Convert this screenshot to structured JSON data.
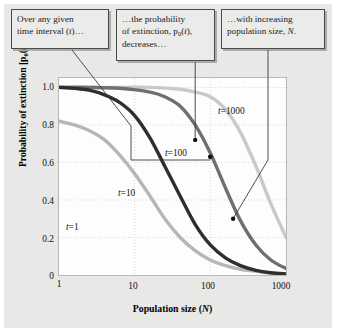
{
  "figure": {
    "background_color": "#e8e8e6",
    "plot_background_color": "#fdfdfd"
  },
  "callouts": [
    {
      "name": "callout-time-interval",
      "line1": "Over any given",
      "line2_pre": "time interval (",
      "line2_var": "t",
      "line2_post": ")…"
    },
    {
      "name": "callout-probability",
      "line1": "…the probability",
      "line2_pre": "of extinction, p",
      "line2_sub": "0",
      "line2_var": "t",
      "line2_post": "),",
      "line3": "decreases…"
    },
    {
      "name": "callout-population-size",
      "line1": "…with increasing",
      "line2_pre": "population size, ",
      "line2_var": "N",
      "line2_post": "."
    }
  ],
  "chart_data": {
    "type": "line",
    "title": "",
    "xlabel_pre": "Population size (",
    "xlabel_var": "N",
    "xlabel_post": ")",
    "ylabel_pre": "Probability of extinction [p",
    "ylabel_sub": "0",
    "ylabel_var": "t",
    "ylabel_post": ")]",
    "x_scale": "log",
    "xlim": [
      1,
      1000
    ],
    "ylim": [
      0,
      1.05
    ],
    "grid": "dotted",
    "legend_position": "inline-labels",
    "xticks": [
      "1",
      "10",
      "100",
      "1000"
    ],
    "xtick_values": [
      1,
      10,
      100,
      1000
    ],
    "yticks": [
      "0",
      "0.2",
      "0.4",
      "0.6",
      "0.8",
      "1.0"
    ],
    "ytick_values": [
      0,
      0.2,
      0.4,
      0.6,
      0.8,
      1.0
    ],
    "series": [
      {
        "name": "t = 1",
        "label_var": "t",
        "label_value": "1",
        "color": "#b6b6b4",
        "x": [
          1,
          1.6,
          2.5,
          4,
          6.3,
          10,
          16,
          25,
          40,
          63,
          100,
          160,
          250,
          400,
          630,
          1000
        ],
        "values": [
          0.82,
          0.8,
          0.77,
          0.72,
          0.64,
          0.54,
          0.42,
          0.3,
          0.2,
          0.13,
          0.08,
          0.05,
          0.03,
          0.02,
          0.01,
          0.005
        ]
      },
      {
        "name": "t = 10",
        "label_var": "t",
        "label_value": "10",
        "color": "#2e2e2e",
        "x": [
          1,
          1.6,
          2.5,
          4,
          6.3,
          10,
          16,
          25,
          40,
          63,
          100,
          160,
          250,
          400,
          630,
          1000
        ],
        "values": [
          1.0,
          0.995,
          0.985,
          0.96,
          0.92,
          0.85,
          0.73,
          0.58,
          0.42,
          0.27,
          0.16,
          0.09,
          0.05,
          0.025,
          0.012,
          0.006
        ]
      },
      {
        "name": "t = 100",
        "label_var": "t",
        "label_value": "100",
        "color": "#6f6f6f",
        "x": [
          1,
          2.5,
          6.3,
          16,
          25,
          40,
          63,
          100,
          160,
          250,
          400,
          630,
          1000
        ],
        "values": [
          1.0,
          1.0,
          0.995,
          0.975,
          0.95,
          0.9,
          0.8,
          0.65,
          0.46,
          0.29,
          0.16,
          0.08,
          0.035
        ]
      },
      {
        "name": "t = 1000",
        "label_var": "t",
        "label_value": "1000",
        "color": "#c9c9c7",
        "x": [
          1,
          6.3,
          16,
          40,
          63,
          100,
          160,
          250,
          400,
          630,
          1000
        ],
        "values": [
          1.0,
          1.0,
          1.0,
          0.99,
          0.975,
          0.95,
          0.88,
          0.76,
          0.58,
          0.38,
          0.2
        ]
      }
    ],
    "annotation_markers": [
      {
        "name": "marker-probability",
        "x": 63,
        "y": 0.72
      },
      {
        "name": "marker-t100",
        "x": 100,
        "y": 0.63
      },
      {
        "name": "marker-population",
        "x": 200,
        "y": 0.3
      }
    ]
  }
}
